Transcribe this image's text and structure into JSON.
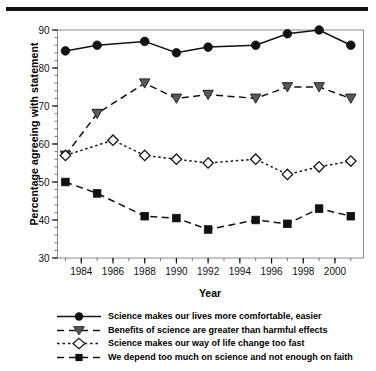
{
  "chart_data": {
    "type": "line",
    "title": "",
    "xlabel": "Year",
    "ylabel": "Percentage agreeing with statement",
    "x": [
      1983,
      1985,
      1986,
      1988,
      1990,
      1992,
      1995,
      1997,
      1999,
      2001
    ],
    "xlim": [
      1982.5,
      2001.8
    ],
    "ylim": [
      30,
      90
    ],
    "xticks": [
      1984,
      1986,
      1988,
      1990,
      1992,
      1994,
      1996,
      1998,
      2000
    ],
    "xtick_labels": [
      "1984",
      "1986",
      "1988",
      "1990",
      "1992",
      "1994",
      "1996",
      "1998",
      "2000"
    ],
    "xminor_step": 1,
    "yticks": [
      30,
      40,
      50,
      60,
      70,
      80,
      90
    ],
    "ytick_labels": [
      "30",
      "40",
      "50",
      "60",
      "70",
      "80",
      "90"
    ],
    "yminor_step": 2,
    "grid": false,
    "legend_position": "below-axes",
    "series": [
      {
        "name": "Science makes our lives more comfortable, easier",
        "marker": "circle-filled",
        "linestyle": "solid",
        "color": "#111111",
        "x": [
          1983,
          1985,
          1988,
          1990,
          1992,
          1995,
          1997,
          1999,
          2001
        ],
        "values": [
          84.5,
          86,
          87,
          84,
          85.5,
          86,
          89,
          90,
          86
        ]
      },
      {
        "name": "Benefits of science are greater than harmful effects",
        "marker": "triangle-down-filled",
        "linestyle": "dashed",
        "color": "#555555",
        "x": [
          1983,
          1985,
          1988,
          1990,
          1992,
          1995,
          1997,
          1999,
          2001
        ],
        "values": [
          57,
          68,
          76,
          72,
          73,
          72,
          75,
          75,
          72
        ]
      },
      {
        "name": "Science makes our way of life change too fast",
        "marker": "diamond-open",
        "linestyle": "dotted",
        "color": "#222222",
        "x": [
          1983,
          1986,
          1988,
          1990,
          1992,
          1995,
          1997,
          1999,
          2001
        ],
        "values": [
          57,
          61,
          57,
          56,
          55,
          56,
          52,
          54,
          55.5
        ]
      },
      {
        "name": "We depend too much on science and not enough on faith",
        "marker": "square-filled",
        "linestyle": "dashed",
        "color": "#111111",
        "x": [
          1983,
          1985,
          1988,
          1990,
          1992,
          1995,
          1997,
          1999,
          2001
        ],
        "values": [
          50,
          47,
          41,
          40.5,
          37.5,
          40,
          39,
          43,
          41
        ]
      }
    ]
  },
  "axis": {
    "y_title": "Percentage agreeing with statement",
    "x_title": "Year"
  },
  "legend": {
    "items": [
      {
        "label": "Science makes our lives more comfortable, easier"
      },
      {
        "label": "Benefits of science are greater than harmful effects"
      },
      {
        "label": "Science makes our way of life change too fast"
      },
      {
        "label": "We depend too much on science and not enough on faith"
      }
    ]
  }
}
